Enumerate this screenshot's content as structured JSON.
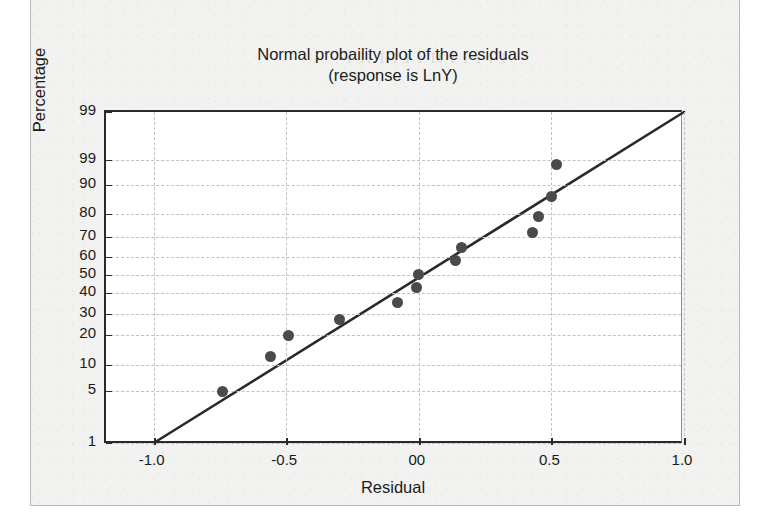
{
  "document": {
    "background_color": "#f2f2f0",
    "page_color": "#ffffff",
    "bleed_ghost_text": "I II I  I  I I  II  I I   I  I I"
  },
  "chart_data": {
    "type": "scatter",
    "title_line1": "Normal probaility plot of the residuals",
    "title_line2": "(response is LnY)",
    "xlabel": "Residual",
    "ylabel": "Percentage",
    "grid": true,
    "legend": "none",
    "marker_color": "#4a4a4a",
    "line_color": "#2a2a2a",
    "axis_color": "#2a2a2a",
    "grid_color": "#c2c2c2",
    "xlim": [
      -1.18,
      1.0
    ],
    "xticks": [
      -1.0,
      -0.5,
      0.0,
      0.5,
      1.0
    ],
    "xticklabels": [
      "-1.0",
      "-0.5",
      "00",
      "0.5",
      "1.0"
    ],
    "yticks": [
      99.9,
      99,
      90,
      80,
      70,
      60,
      50,
      40,
      30,
      20,
      10,
      5,
      1
    ],
    "yticklabels": [
      "99",
      "99",
      "90",
      "80",
      "70",
      "60",
      "50",
      "40",
      "30",
      "20",
      "10",
      "5",
      "1"
    ],
    "ytick_pixel_y": [
      0,
      48,
      73,
      102,
      125,
      145,
      163,
      181,
      202,
      223,
      253,
      279,
      331
    ],
    "y_scale": "normal-probability",
    "reference_line": {
      "label": "fitted normal line",
      "x_start": -1.0,
      "y_start_percent": 1,
      "x_end": 1.0,
      "y_end_percent": 99.9
    },
    "points": [
      {
        "index": 1,
        "residual": -0.74,
        "percentage": 5.0
      },
      {
        "index": 2,
        "residual": -0.56,
        "percentage": 13.0
      },
      {
        "index": 3,
        "residual": -0.49,
        "percentage": 20.0
      },
      {
        "index": 4,
        "residual": -0.3,
        "percentage": 27.5
      },
      {
        "index": 5,
        "residual": -0.08,
        "percentage": 35.5
      },
      {
        "index": 6,
        "residual": -0.01,
        "percentage": 43.0
      },
      {
        "index": 7,
        "residual": 0.0,
        "percentage": 50.5
      },
      {
        "index": 8,
        "residual": 0.14,
        "percentage": 58.0
      },
      {
        "index": 9,
        "residual": 0.16,
        "percentage": 65.0
      },
      {
        "index": 10,
        "residual": 0.43,
        "percentage": 72.0
      },
      {
        "index": 11,
        "residual": 0.45,
        "percentage": 79.0
      },
      {
        "index": 12,
        "residual": 0.5,
        "percentage": 86.0
      },
      {
        "index": 13,
        "residual": 0.52,
        "percentage": 97.5
      }
    ]
  }
}
